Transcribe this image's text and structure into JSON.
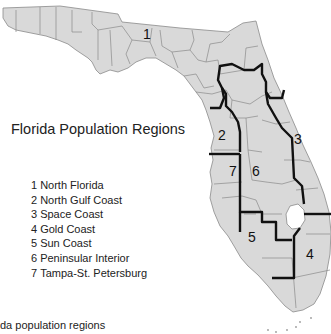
{
  "map": {
    "title": "Florida Population Regions",
    "caption": "da population regions",
    "colors": {
      "land_fill": "#d9d9d9",
      "county_line": "#8a8a8a",
      "region_boundary": "#111111",
      "lake_fill": "#ffffff",
      "background": "#ffffff"
    },
    "region_labels": [
      {
        "number": "1",
        "x": 146,
        "y": 28
      },
      {
        "number": "2",
        "x": 218,
        "y": 128
      },
      {
        "number": "3",
        "x": 295,
        "y": 133
      },
      {
        "number": "4",
        "x": 306,
        "y": 248
      },
      {
        "number": "5",
        "x": 251,
        "y": 232
      },
      {
        "number": "6",
        "x": 251,
        "y": 165
      },
      {
        "number": "7",
        "x": 228,
        "y": 165
      }
    ],
    "legend": [
      {
        "number": "1",
        "name": "North Florida"
      },
      {
        "number": "2",
        "name": "North Gulf Coast"
      },
      {
        "number": "3",
        "name": "Space Coast"
      },
      {
        "number": "4",
        "name": "Gold Coast"
      },
      {
        "number": "5",
        "name": "Sun Coast"
      },
      {
        "number": "6",
        "name": "Peninsular Interior"
      },
      {
        "number": "7",
        "name": "Tampa-St. Petersburg"
      }
    ]
  }
}
